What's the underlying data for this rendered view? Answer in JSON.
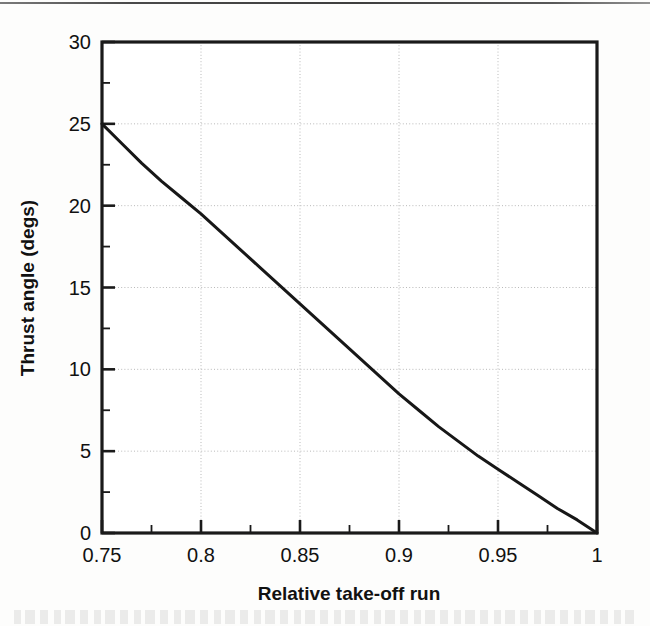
{
  "figure": {
    "background_color": "#fdfdfc",
    "ink_color": "#171717",
    "grid_color": "#b9b9b9",
    "top_rule_present": true
  },
  "chart_data": {
    "type": "line",
    "title": "",
    "xlabel": "Relative take-off run",
    "ylabel": "Thrust angle (degs)",
    "xlim": [
      0.75,
      1
    ],
    "ylim": [
      0,
      30
    ],
    "grid": true,
    "legend": null,
    "x_ticks": [
      0.75,
      0.8,
      0.85,
      0.9,
      0.95,
      1
    ],
    "x_tick_labels": [
      "0.75",
      "0.8",
      "0.85",
      "0.9",
      "0.95",
      "1"
    ],
    "x_minor_ticks": [
      0.775,
      0.825,
      0.875,
      0.925,
      0.975
    ],
    "y_ticks": [
      0,
      5,
      10,
      15,
      20,
      25,
      30
    ],
    "y_tick_labels": [
      "0",
      "5",
      "10",
      "15",
      "20",
      "25",
      "30"
    ],
    "y_minor_ticks": [
      2.5,
      7.5,
      12.5,
      17.5,
      22.5,
      27.5
    ],
    "series": [
      {
        "name": "Thrust angle vs relative take-off run",
        "x": [
          0.75,
          0.76,
          0.77,
          0.78,
          0.79,
          0.8,
          0.81,
          0.82,
          0.83,
          0.84,
          0.85,
          0.86,
          0.87,
          0.88,
          0.89,
          0.9,
          0.91,
          0.92,
          0.93,
          0.94,
          0.95,
          0.96,
          0.97,
          0.98,
          0.99,
          1
        ],
        "y": [
          25.0,
          23.8,
          22.6,
          21.5,
          20.5,
          19.5,
          18.4,
          17.3,
          16.2,
          15.1,
          14.0,
          12.9,
          11.8,
          10.7,
          9.6,
          8.5,
          7.5,
          6.5,
          5.6,
          4.7,
          3.9,
          3.1,
          2.3,
          1.5,
          0.8,
          0.0
        ]
      }
    ]
  },
  "axes": {
    "y_axis_label": "Thrust angle (degs)",
    "x_axis_label": "Relative take-off run"
  }
}
